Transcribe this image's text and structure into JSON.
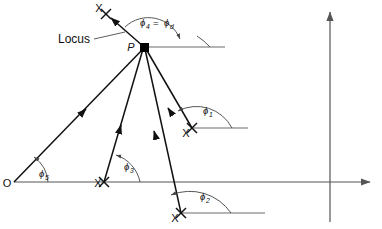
{
  "figure": {
    "type": "geometry-diagram",
    "background_color": "#ffffff",
    "line_color": "#111111",
    "axis_color": "#555555"
  },
  "labels": {
    "locus": "Locus",
    "point_p": "P",
    "origin": "O",
    "marker_x": "X",
    "phi_symbol": "ϕ",
    "equals": "="
  },
  "angles": [
    {
      "id": "phi1",
      "symbol": "ϕ",
      "subscript": "1",
      "label": "ϕ1"
    },
    {
      "id": "phi2",
      "symbol": "ϕ",
      "subscript": "2",
      "label": "ϕ2"
    },
    {
      "id": "phi3",
      "symbol": "ϕ",
      "subscript": "3",
      "label": "ϕ3"
    },
    {
      "id": "phi4",
      "symbol": "ϕ",
      "subscript": "4",
      "label": "ϕ4"
    },
    {
      "id": "phid",
      "symbol": "ϕ",
      "subscript": "d",
      "label": "ϕd"
    },
    {
      "id": "phi5",
      "symbol": "ϕ",
      "subscript": "5",
      "label": "ϕ5"
    }
  ],
  "points": {
    "P": {
      "label": "P",
      "x": 144,
      "y": 47
    },
    "O": {
      "label": "O",
      "x": 14,
      "y": 182
    },
    "X_top": {
      "label": "X",
      "x": 106,
      "y": 14
    },
    "X_right": {
      "label": "X",
      "x": 192,
      "y": 128
    },
    "X_mid": {
      "label": "X",
      "x": 104,
      "y": 182
    },
    "X_low": {
      "label": "X",
      "x": 181,
      "y": 213
    }
  },
  "markers": {
    "x_count": 4,
    "p_node_shape": "filled-square"
  }
}
